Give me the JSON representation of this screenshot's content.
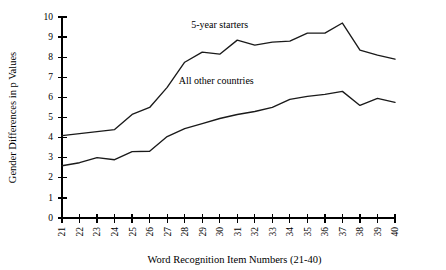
{
  "chart_data": {
    "type": "line",
    "title": "",
    "xlabel": "Word Recognition Item Numbers (21-40)",
    "ylabel": "Gender Differences in p Values",
    "x": [
      21,
      22,
      23,
      24,
      25,
      26,
      27,
      28,
      29,
      30,
      31,
      32,
      33,
      34,
      35,
      36,
      37,
      38,
      39,
      40
    ],
    "xtick_labels": [
      "21",
      "22",
      "23",
      "24",
      "25",
      "26",
      "27",
      "28",
      "29",
      "30",
      "31",
      "32",
      "33",
      "34",
      "35",
      "36",
      "37",
      "38",
      "39",
      "40"
    ],
    "ytick_labels": [
      "0",
      "1",
      "2",
      "3",
      "4",
      "5",
      "6",
      "7",
      "8",
      "9",
      "10"
    ],
    "xlim": [
      21,
      40
    ],
    "ylim": [
      0,
      10
    ],
    "grid": false,
    "legend_position": "inline-annotations",
    "series": [
      {
        "name": "5-year starters",
        "label_x": 30.0,
        "label_y": 9.45,
        "color": "#1a1a1a",
        "values": [
          4.1,
          4.2,
          4.3,
          4.4,
          5.15,
          5.5,
          6.5,
          7.75,
          8.25,
          8.15,
          8.85,
          8.6,
          8.75,
          8.8,
          9.2,
          9.2,
          9.7,
          8.35,
          8.1,
          7.9
        ]
      },
      {
        "name": "All other countries",
        "label_x": 29.8,
        "label_y": 6.65,
        "color": "#1a1a1a",
        "values": [
          2.6,
          2.75,
          3.0,
          2.9,
          3.3,
          3.32,
          4.05,
          4.45,
          4.7,
          4.95,
          5.15,
          5.3,
          5.5,
          5.9,
          6.05,
          6.15,
          6.3,
          5.6,
          5.95,
          5.75
        ]
      }
    ]
  }
}
